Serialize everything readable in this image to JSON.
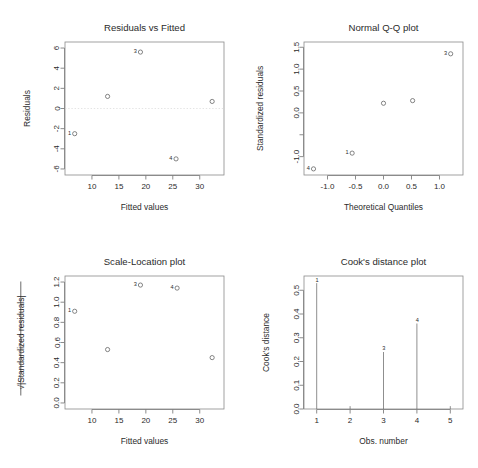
{
  "figure": {
    "name": "regression-diagnostic-plots",
    "panel_count": 4,
    "background": "#ffffff",
    "point_color": "#5c5c5c",
    "text_color": "#2b2b2b",
    "frame_color": "#8a8a8a"
  },
  "chart_data": [
    {
      "type": "scatter",
      "name": "residuals-vs-fitted",
      "title": "Residuals vs Fitted",
      "xlabel": "Fitted values",
      "ylabel": "Residuals",
      "xlim": [
        5.0,
        34.5
      ],
      "ylim": [
        -6.6,
        6.6
      ],
      "xticks": [
        10,
        15,
        20,
        25,
        30
      ],
      "xticklabels": [
        "10",
        "15",
        "20",
        "25",
        "30"
      ],
      "yticks": [
        -6,
        -4,
        -2,
        0,
        2,
        4,
        6
      ],
      "yticklabels": [
        "-6",
        "-4",
        "-2",
        "0",
        "2",
        "4",
        "6"
      ],
      "grid": false,
      "legend": "none",
      "reference_line": {
        "type": "horizontal",
        "y": 0,
        "style": "dotted"
      },
      "x": [
        6.8,
        12.9,
        19.0,
        25.6,
        32.3
      ],
      "y": [
        -2.5,
        1.2,
        5.6,
        -5.0,
        0.7
      ],
      "labels": [
        "1",
        "",
        "3",
        "4",
        ""
      ],
      "label_side": [
        "left",
        "",
        "left",
        "left",
        ""
      ]
    },
    {
      "type": "scatter",
      "name": "normal-qq-plot",
      "title": "Normal Q-Q plot",
      "xlabel": "Theoretical Quantiles",
      "ylabel": "Standardized residuals",
      "xlim": [
        -1.42,
        1.42
      ],
      "ylim": [
        -1.42,
        1.62
      ],
      "xticks": [
        -1.0,
        -0.5,
        0.0,
        0.5,
        1.0
      ],
      "xticklabels": [
        "-1.0",
        "-0.5",
        "0.0",
        "0.5",
        "1.0"
      ],
      "yticks": [
        -1.0,
        -0.5,
        0.0,
        0.5,
        1.0,
        1.5
      ],
      "yticklabels": [
        "-1.0",
        "",
        "0.0",
        "0.5",
        "1.0",
        "1.5"
      ],
      "grid": false,
      "legend": "none",
      "x": [
        -1.25,
        -0.56,
        0.0,
        0.52,
        1.2
      ],
      "y": [
        -1.28,
        -0.92,
        0.22,
        0.28,
        1.35
      ],
      "labels": [
        "4",
        "1",
        "",
        "",
        "3"
      ],
      "label_side": [
        "left",
        "left",
        "",
        "",
        "left"
      ]
    },
    {
      "type": "scatter",
      "name": "scale-location-plot",
      "title": "Scale-Location plot",
      "xlabel": "Fitted values",
      "ylabel": "√|Standardized residuals|",
      "xlim": [
        5.0,
        34.5
      ],
      "ylim": [
        -0.06,
        1.26
      ],
      "xticks": [
        10,
        15,
        20,
        25,
        30
      ],
      "xticklabels": [
        "10",
        "15",
        "20",
        "25",
        "30"
      ],
      "yticks": [
        0.0,
        0.2,
        0.4,
        0.6,
        0.8,
        1.0,
        1.2
      ],
      "yticklabels": [
        "0.0",
        "0.2",
        "0.4",
        "0.6",
        "0.8",
        "1.0",
        "1.2"
      ],
      "grid": false,
      "legend": "none",
      "x": [
        6.8,
        12.9,
        19.0,
        25.8,
        32.3
      ],
      "y": [
        0.91,
        0.53,
        1.17,
        1.14,
        0.45
      ],
      "labels": [
        "1",
        "",
        "3",
        "4",
        ""
      ],
      "label_side": [
        "left",
        "",
        "left",
        "left",
        ""
      ]
    },
    {
      "type": "bar",
      "name": "cooks-distance-plot",
      "title": "Cook's distance plot",
      "xlabel": "Obs. number",
      "ylabel": "Cook's distance",
      "xlim": [
        0.62,
        5.38
      ],
      "ylim": [
        0.0,
        0.56
      ],
      "xticks": [
        1,
        2,
        3,
        4,
        5
      ],
      "xticklabels": [
        "1",
        "2",
        "3",
        "4",
        "5"
      ],
      "yticks": [
        0.0,
        0.1,
        0.2,
        0.3,
        0.4,
        0.5
      ],
      "yticklabels": [
        "0.0",
        "0.1",
        "0.2",
        "0.3",
        "0.4",
        "0.5"
      ],
      "grid": false,
      "legend": "none",
      "categories": [
        "1",
        "2",
        "3",
        "4",
        "5"
      ],
      "values": [
        0.53,
        0.012,
        0.24,
        0.36,
        0.012
      ],
      "labels": [
        "1",
        "",
        "3",
        "4",
        ""
      ]
    }
  ]
}
